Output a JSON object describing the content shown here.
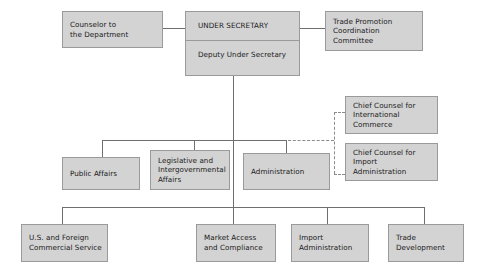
{
  "chart": {
    "colors": {
      "box_fill": "#d3d3d3",
      "box_border": "#9a9a9a",
      "connector": "#6f6f6f",
      "text": "#1a1a1a",
      "background": "#ffffff"
    },
    "nodes": {
      "counselor": {
        "label": "Counselor to\nthe Department"
      },
      "under_secretary": {
        "label": "UNDER SECRETARY"
      },
      "deputy_under_secretary": {
        "label": "Deputy Under Secretary"
      },
      "trade_promotion": {
        "label": "Trade Promotion\nCoordination\nCommittee"
      },
      "chief_counsel_international": {
        "label": "Chief Counsel for\nInternational\nCommerce"
      },
      "chief_counsel_import": {
        "label": "Chief Counsel for\nImport\nAdministration"
      },
      "public_affairs": {
        "label": "Public Affairs"
      },
      "legislative": {
        "label": "Legislative and\nIntergovernmental\nAffairs"
      },
      "administration": {
        "label": "Administration"
      },
      "commercial_service": {
        "label": "U.S. and Foreign\nCommercial Service"
      },
      "market_access": {
        "label": "Market Access\nand Compliance"
      },
      "import_administration": {
        "label": "Import\nAdministration"
      },
      "trade_development": {
        "label": "Trade\nDevelopment"
      }
    }
  }
}
